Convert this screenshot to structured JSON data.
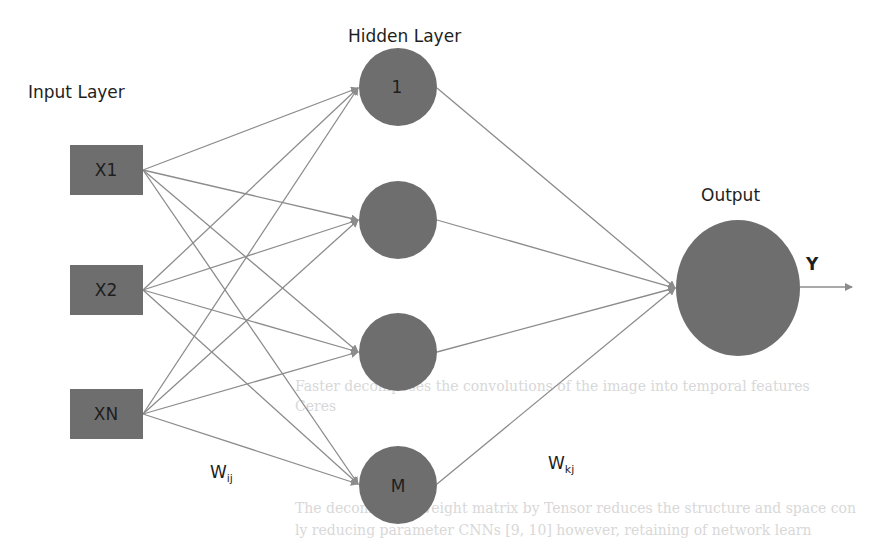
{
  "diagram": {
    "type": "neural-network",
    "labels": {
      "input_layer": "Input Layer",
      "hidden_layer": "Hidden Layer",
      "output": "Output",
      "output_y": "Y",
      "weight_input_hidden": {
        "base": "W",
        "sub": "ij"
      },
      "weight_hidden_output": {
        "base": "W",
        "sub": "kj"
      }
    },
    "input_nodes": [
      {
        "id": "x1",
        "label": "X1"
      },
      {
        "id": "x2",
        "label": "X2"
      },
      {
        "id": "xn",
        "label": "XN"
      }
    ],
    "hidden_nodes": [
      {
        "id": "h1",
        "label": "1"
      },
      {
        "id": "h2",
        "label": ""
      },
      {
        "id": "h3",
        "label": ""
      },
      {
        "id": "hm",
        "label": "M"
      }
    ],
    "output_nodes": [
      {
        "id": "out",
        "label": ""
      }
    ],
    "colors": {
      "node_fill": "#6e6e6e",
      "edge": "#8c8c8c",
      "text": "#1e1e1e",
      "background": "#ffffff"
    }
  },
  "bleed_through": {
    "caption": "Faster decomposes the convolutions of the image into temporal features",
    "caption_line2": "Ceres",
    "body_line1": "The decomposed weight matrix by Tensor reduces the structure and space con",
    "body_line2": "ly reducing parameter CNNs [9, 10] however, retaining of network learn"
  }
}
